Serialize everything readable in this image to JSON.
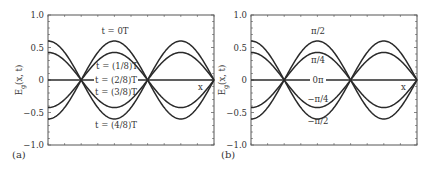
{
  "chart_data": [
    {
      "type": "line",
      "panel_label": "(a)",
      "title": "",
      "xlabel": "x",
      "ylabel": "E_g(x, t)",
      "ylabel_main": "E",
      "ylabel_sub": "g",
      "ylabel_rest": "(x, t)",
      "ylim": [
        -1.0,
        1.0
      ],
      "yticks": [
        -1.0,
        -0.5,
        0,
        0.5,
        1.0
      ],
      "ytick_labels": [
        "−1.0",
        "−0.5",
        "0",
        "0.5",
        "1.0"
      ],
      "grid": false,
      "legend": "inline annotations",
      "x_range_wavelengths": [
        0,
        1.25
      ],
      "description": "Standing wave E(x,t) = 0.6 cos(kx) cos(ωt) sampled at several times",
      "amplitude": 0.6,
      "series": [
        {
          "name": "t = 0T",
          "amplitude_factor": 1.0,
          "peak_value": 0.6,
          "label_pos": [
            115,
            34
          ]
        },
        {
          "name": "t = (1/8)T",
          "amplitude_factor": 0.707,
          "peak_value": 0.42,
          "label_pos": [
            117,
            69
          ]
        },
        {
          "name": "t = (2/8)T",
          "amplitude_factor": 0.0,
          "peak_value": 0.0,
          "label_pos": [
            116,
            83
          ]
        },
        {
          "name": "t = (3/8)T",
          "amplitude_factor": -0.707,
          "peak_value": -0.42,
          "label_pos": [
            116,
            95
          ]
        },
        {
          "name": "t = (4/8)T",
          "amplitude_factor": -1.0,
          "peak_value": -0.6,
          "label_pos": [
            116,
            128
          ]
        }
      ]
    },
    {
      "type": "line",
      "panel_label": "(b)",
      "title": "",
      "xlabel": "x",
      "ylabel": "E_g(x, t)",
      "ylabel_main": "E",
      "ylabel_sub": "g",
      "ylabel_rest": "(x, t)",
      "ylim": [
        -1.0,
        1.0
      ],
      "yticks": [
        -1.0,
        -0.5,
        0,
        0.5,
        1.0
      ],
      "ytick_labels": [
        "−1.0",
        "−0.5",
        "0",
        "0.5",
        "1.0"
      ],
      "grid": false,
      "legend": "inline annotations",
      "x_range_wavelengths": [
        0,
        1.25
      ],
      "description": "Standing wave curves labeled by phase",
      "amplitude": 0.6,
      "series": [
        {
          "name": "π/2",
          "amplitude_factor": 1.0,
          "peak_value": 0.6,
          "label_pos": [
            318,
            34
          ]
        },
        {
          "name": "π/4",
          "amplitude_factor": 0.707,
          "peak_value": 0.42,
          "label_pos": [
            318,
            63
          ]
        },
        {
          "name": "0π",
          "amplitude_factor": 0.0,
          "peak_value": 0.0,
          "label_pos": [
            318,
            83
          ]
        },
        {
          "name": "−π/4",
          "amplitude_factor": -0.707,
          "peak_value": -0.42,
          "label_pos": [
            318,
            102
          ]
        },
        {
          "name": "−π/2",
          "amplitude_factor": -1.0,
          "peak_value": -0.6,
          "label_pos": [
            318,
            124
          ]
        }
      ]
    }
  ]
}
